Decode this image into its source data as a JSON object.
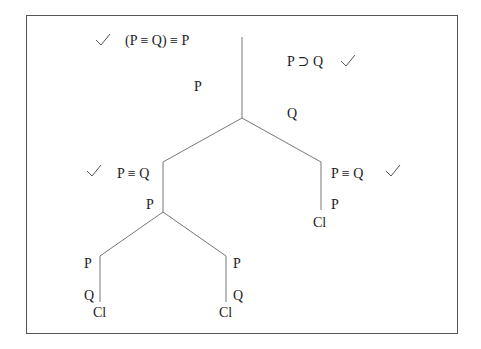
{
  "diagram": {
    "type": "truth-tree",
    "colors": {
      "line": "#777777",
      "text": "#222222",
      "border": "#555555",
      "background": "#ffffff"
    },
    "root": {
      "formula": "(P ≡ Q) ≡ P",
      "checked": true
    },
    "premise": {
      "formula": "P ⊃ Q",
      "checked": true
    },
    "trunk": {
      "left_label": "P",
      "right_label": "Q"
    },
    "left_branch": {
      "formula": "P ≡ Q",
      "checked": true,
      "label": "P",
      "children": [
        {
          "label_1": "P",
          "label_2": "Q",
          "closed": "Cl"
        },
        {
          "label_1": "P",
          "label_2": "Q",
          "closed": "Cl"
        }
      ]
    },
    "right_branch": {
      "formula": "P ≡ Q",
      "checked": true,
      "label": "P",
      "closed": "Cl"
    },
    "icons": {
      "check": "check-mark-icon"
    }
  }
}
